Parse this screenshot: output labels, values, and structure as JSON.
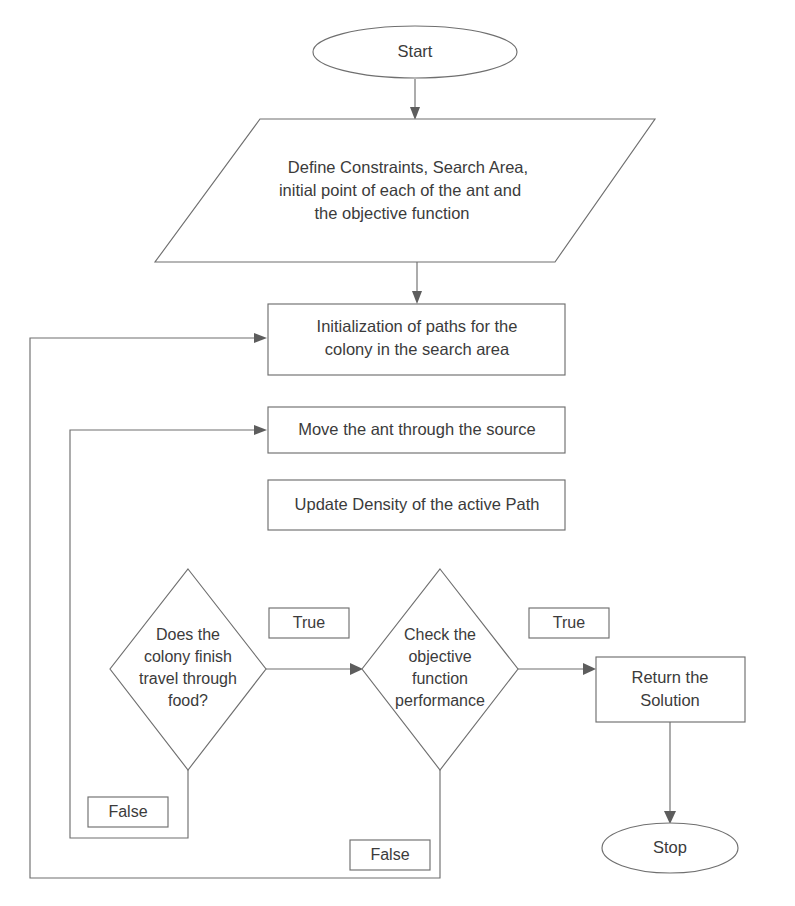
{
  "diagram": {
    "stroke_color": "#6f6f6f",
    "text_color": "#3b3b3b",
    "background_color": "#ffffff",
    "nodes": {
      "start": {
        "label": "Start",
        "shape": "ellipse"
      },
      "define": {
        "shape": "parallelogram",
        "line1": "Define Constraints, Search Area,",
        "line2": "initial point of each of the ant and",
        "line3": "the objective function"
      },
      "initialization": {
        "shape": "process",
        "line1": "Initialization of paths for the",
        "line2": "colony in the search area"
      },
      "move_ant": {
        "shape": "process",
        "line1": "Move the ant through the source"
      },
      "update_density": {
        "shape": "process",
        "line1": "Update Density of the active Path"
      },
      "decision_colony": {
        "shape": "decision",
        "line1": "Does the",
        "line2": "colony finish",
        "line3": "travel through",
        "line4": "food?"
      },
      "decision_objective": {
        "shape": "decision",
        "line1": "Check the",
        "line2": "objective",
        "line3": "function",
        "line4": "performance"
      },
      "return_solution": {
        "shape": "process",
        "line1": "Return the",
        "line2": "Solution"
      },
      "stop": {
        "label": "Stop",
        "shape": "ellipse"
      }
    },
    "edge_labels": {
      "colony_true": "True",
      "colony_false": "False",
      "objective_true": "True",
      "objective_false": "False"
    }
  }
}
